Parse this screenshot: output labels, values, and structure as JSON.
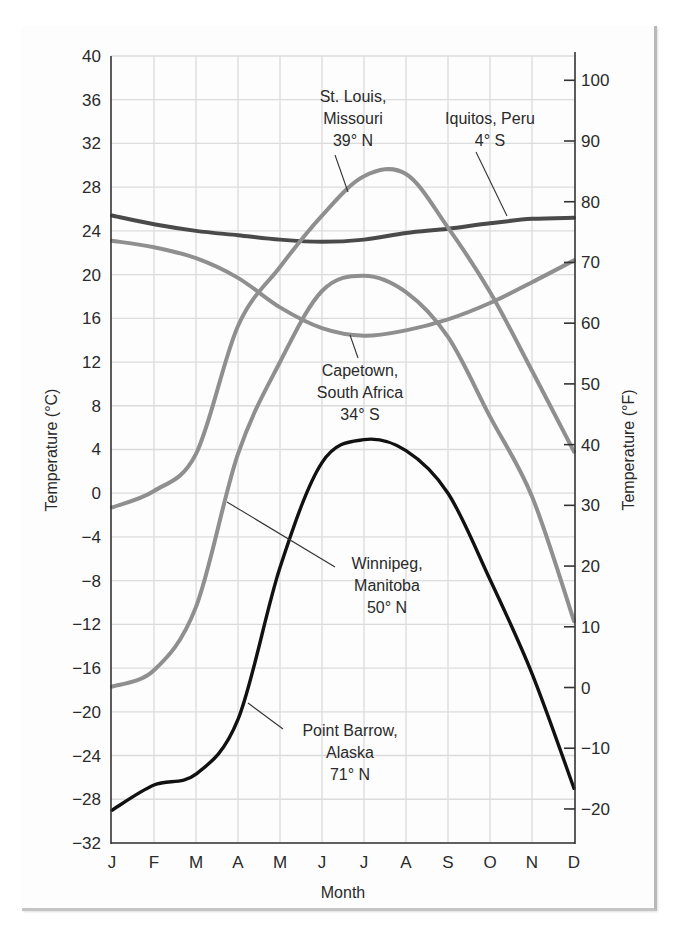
{
  "chart_data": {
    "type": "line",
    "title": "",
    "xlabel": "Month",
    "ylabel": "Temperature (°C)",
    "ylabel_right": "Temperature (°F)",
    "x": [
      "J",
      "F",
      "M",
      "A",
      "M",
      "J",
      "J",
      "A",
      "S",
      "O",
      "N",
      "D"
    ],
    "ylim": [
      -32,
      40
    ],
    "yticks": [
      40,
      36,
      32,
      28,
      24,
      20,
      16,
      12,
      8,
      4,
      0,
      -4,
      -8,
      -12,
      -16,
      -20,
      -24,
      -28,
      -32
    ],
    "ytick_labels": [
      "40",
      "36",
      "32",
      "28",
      "24",
      "20",
      "16",
      "12",
      "8",
      "4",
      "0",
      "-4",
      "-8",
      "-12",
      "-16",
      "-20",
      "-24",
      "-28",
      "-32"
    ],
    "yticks_right_f": [
      100,
      90,
      80,
      70,
      60,
      50,
      40,
      30,
      20,
      10,
      0,
      -10,
      -20
    ],
    "ytick_labels_right": [
      "100",
      "90",
      "80",
      "70",
      "60",
      "50",
      "40",
      "30",
      "20",
      "10",
      "0",
      "-10",
      "-20"
    ],
    "grid": true,
    "legend": "none (inline annotations)",
    "series": [
      {
        "name": "Iquitos, Peru 4° S",
        "color": "#4a4a4a",
        "values": [
          25.4,
          24.6,
          24.0,
          23.6,
          23.2,
          23.0,
          23.2,
          23.8,
          24.2,
          24.7,
          25.1,
          25.2
        ]
      },
      {
        "name": "St. Louis, Missouri 39° N",
        "color": "#8f8f8f",
        "values": [
          -1.3,
          0.2,
          3.6,
          15.3,
          20.7,
          25.4,
          29.0,
          29.2,
          24.3,
          18.4,
          11.2,
          3.8
        ]
      },
      {
        "name": "Capetown, South Africa 34° S",
        "color": "#8f8f8f",
        "values": [
          23.1,
          22.5,
          21.5,
          19.7,
          17.0,
          15.1,
          14.4,
          14.9,
          15.9,
          17.4,
          19.3,
          21.3
        ]
      },
      {
        "name": "Winnipeg, Manitoba 50° N",
        "color": "#8f8f8f",
        "values": [
          -17.7,
          -16.2,
          -10.4,
          3.6,
          12.0,
          18.5,
          19.9,
          18.4,
          14.3,
          7.0,
          -0.3,
          -11.7
        ]
      },
      {
        "name": "Point Barrow, Alaska 71° N",
        "color": "#111111",
        "values": [
          -29.0,
          -26.7,
          -25.7,
          -20.7,
          -6.8,
          2.8,
          4.9,
          3.9,
          0.0,
          -7.9,
          -16.5,
          -27.0
        ]
      }
    ],
    "annotations": [
      {
        "lines": [
          "St. Louis,",
          "Missouri",
          "39° N"
        ],
        "series": "St. Louis"
      },
      {
        "lines": [
          "Iquitos, Peru",
          "4° S"
        ],
        "series": "Iquitos"
      },
      {
        "lines": [
          "Capetown,",
          "South Africa",
          "34° S"
        ],
        "series": "Capetown"
      },
      {
        "lines": [
          "Winnipeg,",
          "Manitoba",
          "50° N"
        ],
        "series": "Winnipeg"
      },
      {
        "lines": [
          "Point Barrow,",
          "Alaska",
          "71° N"
        ],
        "series": "Point Barrow"
      }
    ]
  }
}
